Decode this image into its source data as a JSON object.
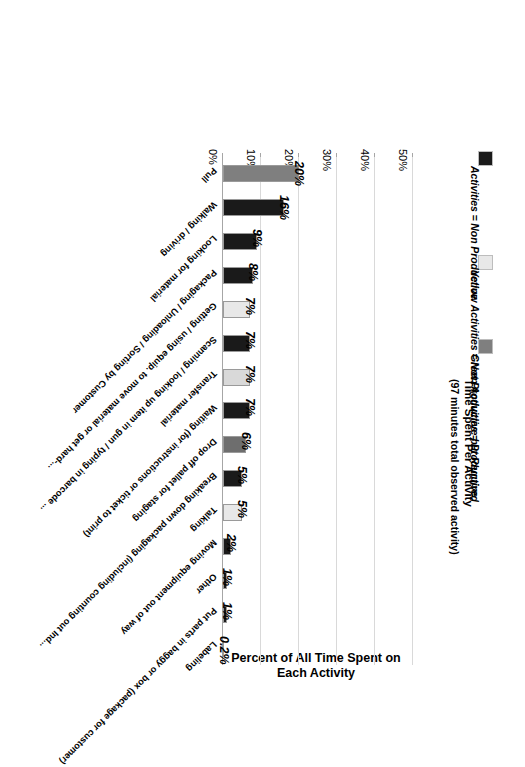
{
  "chart_data": {
    "type": "bar",
    "orientation": "vertical",
    "title": "Time Spent Per Activity",
    "subtitle": "(97 minutes total observed activity)",
    "xlabel": "",
    "ylabel": "Percent of All Time Spent on Each Activity",
    "ylim": [
      0,
      50
    ],
    "ytick_labels": [
      "0%",
      "10%",
      "20%",
      "30%",
      "40%",
      "50%"
    ],
    "ytick_values": [
      0,
      10,
      20,
      30,
      40,
      50
    ],
    "grid": true,
    "legend_position": "top-left",
    "legend": [
      {
        "label": "Green Activities = Productive",
        "color": "#7f7f7f",
        "key": "green"
      },
      {
        "label": "Yellow Activities = Not Productive but Required",
        "color": "#e8e8e8",
        "key": "yellow"
      },
      {
        "label": "Activities = Non Productive",
        "color": "#1a1a1a",
        "key": "red"
      }
    ],
    "categories": [
      "Pull",
      "Walking / driving",
      "Looking for material",
      "Packaging / Unloading / Sorting by Customer",
      "Getting / using equip. to move material or get hard-...",
      "Scanning / looking up item in gun / typing in barcode ...",
      "Transfer material",
      "Waiting (for instructions or ticket to print)",
      "Drop off pallet for staging",
      "Breaking down packaging (including counting out Ind...",
      "Talking",
      "Moving equipment out of way",
      "Other",
      "Put parts in baggy or box (package for customer)",
      "Labeling"
    ],
    "values": [
      20,
      16,
      9,
      8,
      7,
      7,
      7,
      7,
      6,
      5,
      5,
      2,
      1,
      1,
      0.2
    ],
    "value_labels": [
      "20%",
      "16%",
      "9%",
      "8%",
      "7%",
      "7%",
      "7%",
      "7%",
      "6%",
      "5%",
      "5%",
      "2%",
      "1%",
      "1%",
      "0.2%"
    ],
    "colors": [
      "#7f7f7f",
      "#1a1a1a",
      "#1a1a1a",
      "#1a1a1a",
      "#e8e8e8",
      "#1a1a1a",
      "#d9d9d9",
      "#1a1a1a",
      "#6e6e6e",
      "#1a1a1a",
      "#e8e8e8",
      "#1a1a1a",
      "#1a1a1a",
      "#1a1a1a",
      "#1a1a1a"
    ]
  }
}
